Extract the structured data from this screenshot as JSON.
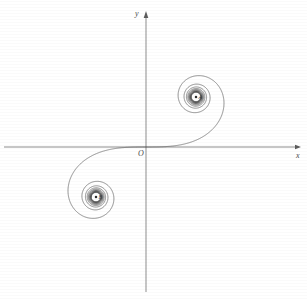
{
  "figure": {
    "background_color": "#ffffff",
    "curve_color": "#4a4a4a",
    "axis_color": "#5a5a5a"
  },
  "axes": {
    "x_label": "x",
    "y_label": "y",
    "origin_label": "O",
    "origin_px": {
      "x": 146,
      "y": 147
    },
    "x_axis_px": {
      "x1": 4,
      "y1": 147,
      "x2": 301,
      "y2": 147
    },
    "y_axis_px": {
      "x1": 146,
      "y1": 292,
      "x2": 146,
      "y2": 12
    },
    "x_arrow": "right",
    "y_arrow": "up"
  },
  "points": [
    {
      "name": "A",
      "label": "A",
      "px": {
        "x": 246,
        "y": 62
      },
      "role": "upper-asymptotic-center"
    },
    {
      "name": "B",
      "label": "B",
      "px": {
        "x": 62,
        "y": 243
      },
      "role": "lower-asymptotic-center"
    }
  ],
  "chart_data": {
    "type": "line",
    "xlabel": "x",
    "ylabel": "y",
    "grid": false,
    "legend": null,
    "parametric": true,
    "parameter": "t",
    "equations": {
      "x": "C(t) = ∫₀ᵗ cos(πu²/2) du",
      "y": "S(t) = ∫₀ᵗ sin(πu²/2) du"
    },
    "t_range": [
      -7.0,
      7.0
    ],
    "xlim": [
      -1.46,
      1.46
    ],
    "ylim": [
      -1.46,
      1.46
    ],
    "px_per_unit": 100,
    "asymptotic_points": [
      {
        "label": "A",
        "x": 0.5,
        "y": 0.5
      },
      {
        "label": "B",
        "x": -0.5,
        "y": -0.5
      }
    ],
    "annotations": [
      {
        "text": "O",
        "x": 0,
        "y": 0
      },
      {
        "text": "A",
        "x": 0.5,
        "y": 0.5
      },
      {
        "text": "B",
        "x": -0.5,
        "y": -0.5
      }
    ],
    "series": [
      {
        "name": "Cornu spiral",
        "color": "#4a4a4a",
        "x": [
          -0.4968,
          -0.5143,
          -0.4998,
          -0.4799,
          -0.484,
          -0.5089,
          -0.5264,
          -0.5188,
          -0.4947,
          -0.479,
          -0.4861,
          -0.5107,
          -0.5291,
          -0.5235,
          -0.4978,
          -0.4754,
          -0.4769,
          -0.5011,
          -0.5261,
          -0.53,
          -0.5078,
          -0.4753,
          -0.4621,
          -0.4818,
          -0.5143,
          -0.5319,
          -0.5207,
          -0.4838,
          -0.4497,
          -0.4474,
          -0.4803,
          -0.521,
          -0.5382,
          -0.516,
          -0.4612,
          -0.4103,
          -0.4039,
          -0.4474,
          -0.5067,
          -0.5403,
          -0.5215,
          -0.4469,
          -0.3536,
          -0.3105,
          -0.3506,
          -0.4542,
          -0.5365,
          -0.5263,
          -0.4187,
          -0.2768,
          -0.18,
          -0.18,
          -0.2785,
          -0.4205,
          -0.5218,
          -0.5195,
          -0.4039,
          -0.2323,
          -0.0723,
          0.023,
          0.023,
          -0.0723,
          -0.2323,
          -0.4039,
          -0.5195,
          -0.5218,
          -0.4205,
          -0.2785,
          -0.18,
          -0.18,
          -0.2768,
          -0.4187,
          -0.5263,
          -0.5365,
          -0.4542,
          -0.3506,
          -0.3105,
          -0.3536,
          -0.4469,
          -0.5215,
          -0.5403,
          -0.5067,
          -0.4474,
          -0.4039,
          -0.4103,
          -0.4612,
          -0.516,
          -0.5382,
          -0.521,
          -0.4803,
          -0.4474,
          -0.4497,
          -0.4838,
          -0.5207,
          -0.5319,
          -0.5143,
          -0.4818,
          -0.4621,
          -0.4753,
          -0.5078,
          -0.53,
          -0.5261,
          -0.5011,
          -0.4769,
          -0.4754,
          -0.4978,
          -0.5235,
          -0.5291,
          -0.5107,
          -0.4861,
          -0.479,
          -0.4947,
          -0.5188,
          -0.5264,
          -0.5089,
          -0.484,
          -0.4799,
          -0.4998,
          -0.5143,
          -0.4968
        ],
        "y": [
          -0.4997,
          -0.4784,
          -0.4566,
          -0.476,
          -0.5055,
          -0.5195,
          -0.4993,
          -0.4694,
          -0.469,
          -0.496,
          -0.5254,
          -0.5228,
          -0.489,
          -0.4588,
          -0.4689,
          -0.5061,
          -0.5297,
          -0.5081,
          -0.4648,
          -0.4491,
          -0.4811,
          -0.5268,
          -0.5298,
          -0.4815,
          -0.4405,
          -0.455,
          -0.5083,
          -0.5405,
          -0.5112,
          -0.4456,
          -0.4217,
          -0.4661,
          -0.5344,
          -0.5501,
          -0.4922,
          -0.4147,
          -0.3976,
          -0.4565,
          -0.5434,
          -0.563,
          -0.4824,
          -0.3739,
          -0.3398,
          -0.42,
          -0.5397,
          -0.5665,
          -0.4544,
          -0.3094,
          -0.266,
          -0.3722,
          -0.5202,
          -0.5386,
          -0.3828,
          -0.2043,
          -0.1381,
          -0.2682,
          -0.4509,
          -0.4977,
          -0.3434,
          -0.1105,
          0.1105,
          0.3434,
          0.4977,
          0.4509,
          0.2682,
          0.1381,
          0.2043,
          0.3828,
          0.5386,
          0.5202,
          0.3722,
          0.266,
          0.3094,
          0.4544,
          0.5665,
          0.5397,
          0.42,
          0.3398,
          0.3739,
          0.4824,
          0.563,
          0.5434,
          0.4565,
          0.3976,
          0.4147,
          0.4922,
          0.5501,
          0.5344,
          0.4661,
          0.4217,
          0.4456,
          0.5112,
          0.5405,
          0.5083,
          0.455,
          0.4405,
          0.4815,
          0.5298,
          0.5268,
          0.4811,
          0.4491,
          0.4648,
          0.5081,
          0.5297,
          0.5061,
          0.4689,
          0.4588,
          0.489,
          0.5228,
          0.5254,
          0.496,
          0.469,
          0.4694,
          0.4993,
          0.5195,
          0.5055,
          0.476,
          0.4566,
          0.4784,
          0.4997
        ]
      }
    ]
  }
}
